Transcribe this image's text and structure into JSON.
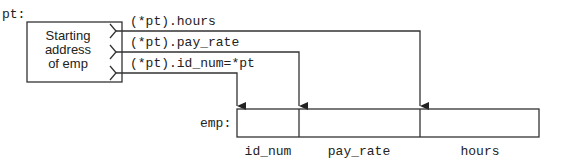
{
  "pointer": {
    "name_label": "pt:",
    "box_text": [
      "Starting",
      "address",
      "of emp"
    ]
  },
  "expressions": {
    "hours": "(*pt).hours",
    "pay_rate": "(*pt).pay_rate",
    "id_num": "(*pt).id_num=*pt"
  },
  "struct": {
    "name_label": "emp:",
    "fields": [
      "id_num",
      "pay_rate",
      "hours"
    ]
  },
  "colors": {
    "line": "#333333",
    "text": "#222222"
  }
}
